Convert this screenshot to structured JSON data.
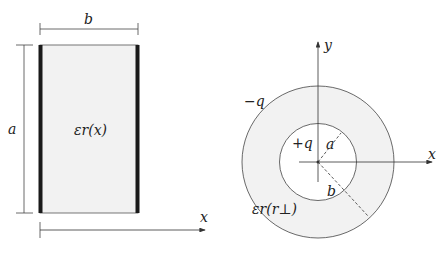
{
  "left_figure": {
    "width_label": "b",
    "height_label": "a",
    "permittivity_label": "εr(x)",
    "axis_label": "x",
    "fill_color": "#f2f2f2",
    "plate_color": "#1a1a1a"
  },
  "right_figure": {
    "y_axis_label": "y",
    "x_axis_label": "x",
    "outer_charge_label": "−q",
    "inner_charge_label": "+q",
    "inner_radius_label": "a",
    "outer_radius_label": "b",
    "permittivity_label": "εr(r⊥)",
    "fill_color": "#f2f2f2"
  }
}
